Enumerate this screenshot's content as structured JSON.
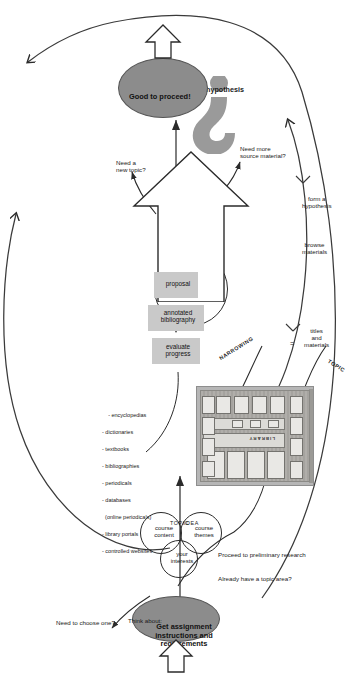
{
  "diagram": {
    "colors": {
      "oval_fill": "#8c8c8c",
      "box_fill": "#c9c9c9",
      "line": "#2b2b2b",
      "paper": "#ffffff"
    },
    "start": {
      "label": "Get assignment instructions and requirements",
      "branch_yes": "Already have a topic area?",
      "branch_no": "Need to choose one?",
      "proceed": "Proceed to preliminary research"
    },
    "brainstorm": {
      "prompt": "Think about:",
      "circles": [
        {
          "label": "course themes"
        },
        {
          "label": "your interests"
        },
        {
          "label": "course content"
        }
      ],
      "arrow_label_top": "TOPIC",
      "arrow_label_bottom": "IDEA"
    },
    "library": {
      "sign": "LIBRARY",
      "sources_heading": "",
      "sources": [
        "- encyclopedias",
        "- dictionaries",
        "- textbooks",
        "- bibliographies",
        "- periodicals",
        "- databases",
        "  (online periodicals)",
        "- library portals",
        "- controlled websites"
      ]
    },
    "narrowing": {
      "left_label": "TOPIC",
      "right_label": "NARROWING",
      "equals": "=",
      "equals_text": "titles\nand\nmaterials"
    },
    "idea_circle": {
      "label": "idea for paper\ntaking shape"
    },
    "big_arrow": {
      "step_1": "browse\nmaterials",
      "step_2": "form a\nhypothesis"
    },
    "hypothesis": {
      "label": "hypothesis"
    },
    "pipeline": [
      {
        "label": "proposal"
      },
      {
        "label": "annotated\nbibliography"
      },
      {
        "label": "evaluate\nprogress"
      }
    ],
    "decisions": {
      "more_source": "Need more\nsource material?",
      "new_topic": "Need a\nnew topic?"
    },
    "end": {
      "label": "Good to proceed!"
    }
  }
}
